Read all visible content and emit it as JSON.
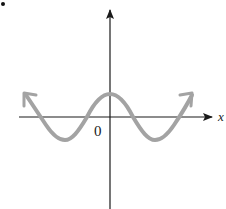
{
  "figure": {
    "type": "function-graph",
    "origin_label": "0",
    "x_axis_label": "x",
    "y_axis_label": "",
    "curve_color": "#a3a3a3",
    "axis_color": "#1a1a1a",
    "curve": {
      "shape": "cos",
      "peak": [
        0,
        1
      ],
      "troughs": [
        [
          -1,
          -1
        ],
        [
          1,
          -1
        ]
      ],
      "ends": "arrows both directions"
    }
  }
}
